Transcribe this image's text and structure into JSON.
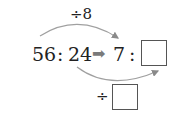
{
  "problem": {
    "top_operation": {
      "symbol": "÷",
      "value": "8"
    },
    "left_ratio": {
      "first": "56",
      "separator": ":",
      "second": "24"
    },
    "arrow": "➡",
    "right_ratio": {
      "first": "7",
      "separator": ":",
      "second_blank": ""
    },
    "bottom_operation": {
      "symbol": "÷",
      "value_blank": ""
    }
  },
  "colors": {
    "arc": "#9a9a9a",
    "arrow": "#8a8a8a",
    "text": "#222222",
    "box_border": "#555555"
  }
}
